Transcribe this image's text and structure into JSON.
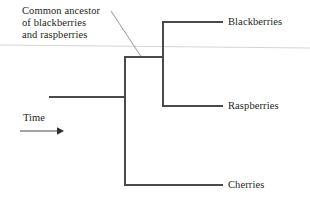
{
  "figure": {
    "type": "cladogram",
    "annotation": {
      "lines": [
        "Common ancestor",
        "of blackberries",
        "and raspberries"
      ],
      "points_to": "inner-node"
    },
    "axis": {
      "label": "Time",
      "direction": "left-to-right",
      "arrow_icon": "right-arrow-icon"
    },
    "taxa": [
      {
        "id": "blackberries",
        "label": "Blackberries"
      },
      {
        "id": "raspberries",
        "label": "Raspberries"
      },
      {
        "id": "cherries",
        "label": "Cherries"
      }
    ],
    "nodes": [
      {
        "id": "root-node",
        "label": "root",
        "children": [
          "inner-node",
          "cherries"
        ]
      },
      {
        "id": "inner-node",
        "label": "Common ancestor of blackberries and raspberries",
        "children": [
          "blackberries",
          "raspberries"
        ]
      }
    ],
    "colors": {
      "line": "#4a4a4a",
      "text": "#231f20",
      "background": "#ffffff",
      "artifact_line": "#cfcfcf"
    }
  }
}
